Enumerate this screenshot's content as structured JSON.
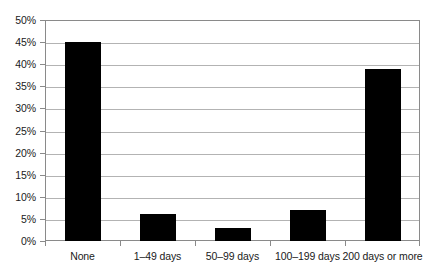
{
  "chart_data": {
    "type": "bar",
    "title": "",
    "subtitle": "",
    "xlabel": "",
    "ylabel": "",
    "categories": [
      "None",
      "1–49 days",
      "50–99 days",
      "100–199 days",
      "200 days or more"
    ],
    "values": [
      45,
      6,
      3,
      7,
      39
    ],
    "value_labels": [
      "45%",
      "6%",
      "3%",
      "7%",
      "39%"
    ],
    "ylim": [
      0,
      50
    ],
    "ytick_values": [
      0,
      5,
      10,
      15,
      20,
      25,
      30,
      35,
      40,
      45,
      50
    ],
    "ytick_labels": [
      "0%",
      "5%",
      "10%",
      "15%",
      "20%",
      "25%",
      "30%",
      "35%",
      "40%",
      "45%",
      "50%"
    ],
    "grid": true,
    "legend": false,
    "legend_position": "none",
    "series": [
      {
        "name": "",
        "values": [
          45,
          6,
          3,
          7,
          39
        ]
      }
    ]
  },
  "style": {
    "bar_color": "#000000",
    "gridline_color": "#b3b3b3",
    "axis_color": "#8a8a8a",
    "background_color": "#ffffff",
    "text_color": "#1a1a1a"
  }
}
